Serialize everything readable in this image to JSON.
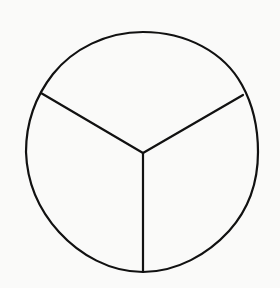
{
  "figure": {
    "title": "Circle divided into three equal sectors",
    "background_color": "#fafaf9",
    "stroke_color": "#111111",
    "stroke_width": 2.2,
    "canvas": {
      "width": 280,
      "height": 288
    },
    "circle": {
      "name": "outer-circle",
      "center_x": 142,
      "center_y": 152,
      "radius_x": 116,
      "radius_y": 120,
      "fill": "none"
    },
    "center_point": {
      "x": 143,
      "y": 153
    },
    "spokes": [
      {
        "name": "upper-left-radius",
        "from_x": 143,
        "from_y": 153,
        "to_x": 41,
        "to_y": 93,
        "angle_degrees": 150
      },
      {
        "name": "upper-right-radius",
        "from_x": 143,
        "from_y": 153,
        "to_x": 243,
        "to_y": 95,
        "angle_degrees": 30
      },
      {
        "name": "lower-vertical-radius",
        "from_x": 143,
        "from_y": 153,
        "to_x": 143,
        "to_y": 272,
        "angle_degrees": 270
      }
    ],
    "sectors": [
      {
        "name": "top-sector",
        "label": ""
      },
      {
        "name": "lower-left-sector",
        "label": ""
      },
      {
        "name": "lower-right-sector",
        "label": ""
      }
    ]
  }
}
